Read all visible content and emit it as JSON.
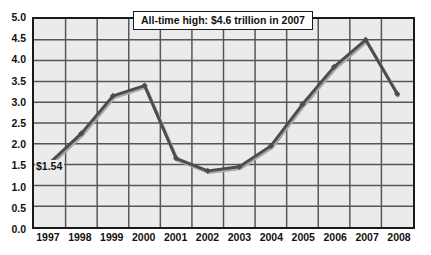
{
  "chart_data": {
    "type": "line",
    "title": "",
    "xlabel": "",
    "ylabel": "",
    "categories": [
      "1997",
      "1998",
      "1999",
      "2000",
      "2001",
      "2002",
      "2003",
      "2004",
      "2005",
      "2006",
      "2007",
      "2008"
    ],
    "values": [
      1.54,
      2.25,
      3.15,
      3.4,
      1.65,
      1.35,
      1.45,
      1.95,
      2.95,
      3.85,
      4.5,
      3.2
    ],
    "series": [
      {
        "name": "Value",
        "values": [
          1.54,
          2.25,
          3.15,
          3.4,
          1.65,
          1.35,
          1.45,
          1.95,
          2.95,
          3.85,
          4.5,
          3.2
        ]
      }
    ],
    "ylim": [
      0.0,
      5.0
    ],
    "ytick_step": 0.5,
    "yticks": [
      "5.0",
      "4.5",
      "4.0",
      "3.5",
      "3.0",
      "2.5",
      "2.0",
      "1.5",
      "1.0",
      "0.5",
      "0.0"
    ],
    "ytick_values": [
      5.0,
      4.5,
      4.0,
      3.5,
      3.0,
      2.5,
      2.0,
      1.5,
      1.0,
      0.5,
      0.0
    ],
    "grid": true,
    "grid_horizontal": true,
    "grid_vertical": true,
    "legend": false,
    "legend_position": "none",
    "annotations": [
      {
        "name": "all-time-high-callout",
        "text": "All-time high: $4.6 trillion in 2007",
        "points_to": "2007"
      },
      {
        "name": "first-point-value-label",
        "text": "$1.54",
        "points_to": "1997"
      }
    ],
    "line_color": "#4d4d4d",
    "marker_color": "#4d4d4d",
    "plot_background": "#ebebeb",
    "axis_color": "#1a1a1a",
    "grid_color": "#565656"
  },
  "callout": {
    "text": "All-time high: $4.6 trillion in 2007"
  },
  "point_label": {
    "text": "$1.54"
  },
  "title": {
    "text": ""
  }
}
